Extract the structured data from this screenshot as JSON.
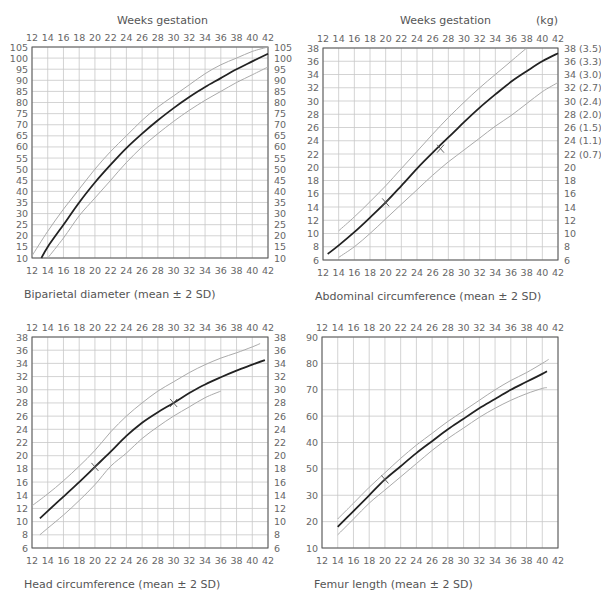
{
  "header": {
    "weeks_label_left": "Weeks gestation",
    "weeks_label_right": "Weeks gestation",
    "kg_label": "(kg)"
  },
  "colors": {
    "grid": "#c8c8c8",
    "frame": "#555555",
    "mean_line": "#222222",
    "sd_line": "#aaaaaa",
    "text": "#666666"
  },
  "chart_data": [
    {
      "id": "bpd",
      "type": "line",
      "title": "Biparietal diameter (mean ± 2 SD)",
      "xlabel": "Weeks gestation",
      "ylabel": "",
      "frame": {
        "x0": 32,
        "x1": 268,
        "y0": 47,
        "y1": 258
      },
      "xlim": [
        12,
        42
      ],
      "ylim": [
        10,
        105
      ],
      "x_ticks": [
        12,
        14,
        16,
        18,
        20,
        22,
        24,
        26,
        28,
        30,
        32,
        34,
        36,
        38,
        40,
        42
      ],
      "y_ticks_left": [
        "105",
        "100",
        "95",
        "90",
        "85",
        "80",
        "75",
        "70",
        "65",
        "60",
        "55",
        "50",
        "45",
        "40",
        "35",
        "30",
        "25",
        "20",
        "15",
        "10"
      ],
      "y_ticks_right": [
        "105",
        "100",
        "95",
        "90",
        "85",
        "80",
        "75",
        "70",
        "65",
        "60",
        "55",
        "50",
        "45",
        "40",
        "35",
        "30",
        "25",
        "20",
        "15",
        "10"
      ],
      "y_tick_values": [
        105,
        100,
        95,
        90,
        85,
        80,
        75,
        70,
        65,
        60,
        55,
        50,
        45,
        40,
        35,
        30,
        25,
        20,
        15,
        10
      ],
      "show_top_ticks": true,
      "show_bottom_ticks": true,
      "grid": true,
      "series": [
        {
          "name": "+2 SD",
          "role": "sd",
          "x": [
            12,
            14,
            16,
            18,
            20,
            22,
            24,
            26,
            28,
            30,
            32,
            34,
            36,
            38,
            40,
            42
          ],
          "y": [
            11,
            22,
            32,
            41,
            50,
            58,
            65,
            72,
            78,
            83,
            88,
            93,
            97,
            100,
            103,
            105
          ]
        },
        {
          "name": "mean",
          "role": "mean",
          "x": [
            13.2,
            14,
            16,
            18,
            20,
            22,
            24,
            26,
            28,
            30,
            32,
            34,
            36,
            38,
            40,
            42
          ],
          "y": [
            10,
            15,
            25,
            35,
            44,
            52,
            59.5,
            66,
            72,
            77.5,
            82.5,
            87,
            91,
            95,
            98.5,
            102
          ]
        },
        {
          "name": "-2 SD",
          "role": "sd",
          "x": [
            14,
            16,
            18,
            20,
            22,
            24,
            26,
            28,
            30,
            32,
            34,
            36,
            38,
            40,
            42
          ],
          "y": [
            10,
            19,
            29,
            37,
            45,
            53,
            60,
            66,
            71.5,
            76.5,
            81,
            85,
            89,
            92.5,
            96
          ]
        }
      ],
      "markers": []
    },
    {
      "id": "ac",
      "type": "line",
      "title": "Abdominal circumference (mean ± 2 SD)",
      "xlabel": "Weeks gestation",
      "ylabel": "",
      "frame": {
        "x0": 323,
        "x1": 558,
        "y0": 48,
        "y1": 260
      },
      "xlim": [
        12,
        42
      ],
      "ylim": [
        6,
        38
      ],
      "x_ticks": [
        12,
        14,
        16,
        18,
        20,
        22,
        24,
        26,
        28,
        30,
        32,
        34,
        36,
        38,
        40,
        42
      ],
      "y_ticks_left": [
        "38",
        "36",
        "34",
        "32",
        "30",
        "28",
        "26",
        "24",
        "22",
        "20",
        "18",
        "16",
        "14",
        "12",
        "10",
        "8",
        "6"
      ],
      "y_ticks_right": [
        "38 (3.5)",
        "36 (3.3)",
        "34 (3.0)",
        "32 (2.7)",
        "30 (2.4)",
        "28 (2.0)",
        "26 (1.5)",
        "24 (1.1)",
        "22 (0.7)",
        "20",
        "18",
        "16",
        "14",
        "12",
        "10",
        "8",
        "6"
      ],
      "y_tick_values": [
        38,
        36,
        34,
        32,
        30,
        28,
        26,
        24,
        22,
        20,
        18,
        16,
        14,
        12,
        10,
        8,
        6
      ],
      "show_top_ticks": true,
      "show_bottom_ticks": true,
      "grid": true,
      "series": [
        {
          "name": "+2 SD",
          "role": "sd",
          "x": [
            14,
            16,
            18,
            20,
            22,
            24,
            26,
            28,
            30,
            32,
            34,
            36,
            38
          ],
          "y": [
            10.4,
            12.5,
            14.8,
            17.2,
            19.8,
            22.4,
            25,
            27.5,
            29.8,
            32,
            34,
            36,
            38
          ]
        },
        {
          "name": "mean",
          "role": "mean",
          "x": [
            12.6,
            14,
            16,
            18,
            20,
            22,
            24,
            26,
            28,
            30,
            32,
            34,
            36,
            38,
            40,
            42
          ],
          "y": [
            6.9,
            8.2,
            10.2,
            12.4,
            14.7,
            17.2,
            19.8,
            22.2,
            24.5,
            26.8,
            29,
            31,
            32.9,
            34.5,
            36,
            37.2
          ]
        },
        {
          "name": "-2 SD",
          "role": "sd",
          "x": [
            14,
            16,
            18,
            20,
            22,
            24,
            26,
            28,
            30,
            32,
            34,
            36,
            38,
            40,
            42
          ],
          "y": [
            6.4,
            8,
            10,
            12.2,
            14.4,
            16.6,
            18.8,
            20.8,
            22.6,
            24.4,
            26.2,
            27.8,
            29.6,
            31.4,
            32.8
          ]
        }
      ],
      "markers": [
        {
          "x": 20,
          "y": 14.7
        },
        {
          "x": 27,
          "y": 22.8
        }
      ]
    },
    {
      "id": "hc",
      "type": "line",
      "title": "Head circumference (mean ± 2 SD)",
      "xlabel": "Weeks gestation",
      "ylabel": "",
      "frame": {
        "x0": 32,
        "x1": 268,
        "y0": 337,
        "y1": 548
      },
      "xlim": [
        12,
        42
      ],
      "ylim": [
        6,
        38
      ],
      "x_ticks": [
        12,
        14,
        16,
        18,
        20,
        22,
        24,
        26,
        28,
        30,
        32,
        34,
        36,
        38,
        40,
        42
      ],
      "y_ticks_left": [
        "38",
        "36",
        "34",
        "32",
        "30",
        "28",
        "26",
        "24",
        "22",
        "20",
        "18",
        "16",
        "14",
        "12",
        "10",
        "8",
        "6"
      ],
      "y_ticks_right": [
        "38",
        "36",
        "34",
        "32",
        "30",
        "28",
        "26",
        "24",
        "22",
        "20",
        "18",
        "16",
        "14",
        "12",
        "10",
        "8",
        "6"
      ],
      "y_tick_values": [
        38,
        36,
        34,
        32,
        30,
        28,
        26,
        24,
        22,
        20,
        18,
        16,
        14,
        12,
        10,
        8,
        6
      ],
      "show_top_ticks": true,
      "show_bottom_ticks": true,
      "grid": true,
      "series": [
        {
          "name": "+2 SD",
          "role": "sd",
          "x": [
            12,
            14,
            16,
            18,
            20,
            22,
            24,
            26,
            28,
            30,
            32,
            34,
            36,
            38,
            40,
            41
          ],
          "y": [
            12.4,
            14.2,
            16.2,
            18.4,
            20.8,
            23.6,
            26,
            28,
            29.8,
            31.2,
            32.6,
            33.8,
            34.8,
            35.6,
            36.5,
            37
          ]
        },
        {
          "name": "mean",
          "role": "mean",
          "x": [
            13,
            14,
            16,
            18,
            20,
            22,
            24,
            26,
            28,
            30,
            32,
            34,
            36,
            38,
            40,
            41.6
          ],
          "y": [
            10.5,
            11.6,
            13.8,
            16,
            18.3,
            20.6,
            23,
            25,
            26.6,
            28,
            29.5,
            30.8,
            31.9,
            32.9,
            33.8,
            34.5
          ]
        },
        {
          "name": "-2 SD",
          "role": "sd",
          "x": [
            13,
            14,
            16,
            18,
            20,
            22,
            24,
            26,
            28,
            30,
            32,
            34,
            36
          ],
          "y": [
            8,
            9,
            11,
            13.2,
            15.6,
            18.4,
            20.4,
            22.6,
            24.4,
            26,
            27.4,
            28.8,
            29.8
          ]
        }
      ],
      "markers": [
        {
          "x": 20,
          "y": 18.3
        },
        {
          "x": 30,
          "y": 28
        }
      ]
    },
    {
      "id": "fl",
      "type": "line",
      "title": "Femur length (mean ± 2 SD)",
      "xlabel": "Weeks gestation",
      "ylabel": "",
      "frame": {
        "x0": 322,
        "x1": 558,
        "y0": 337,
        "y1": 548
      },
      "xlim": [
        12,
        42
      ],
      "ylim": [
        10,
        90
      ],
      "x_ticks": [
        12,
        14,
        16,
        18,
        20,
        22,
        24,
        26,
        28,
        30,
        32,
        34,
        36,
        38,
        40,
        42
      ],
      "y_ticks_left": [
        "90",
        "80",
        "70",
        "60",
        "40",
        "50",
        "30",
        "20",
        "10"
      ],
      "y_ticks_right": [],
      "y_tick_values": [
        90,
        80,
        70,
        60,
        50,
        40,
        30,
        20,
        10
      ],
      "show_top_ticks": true,
      "show_bottom_ticks": true,
      "grid": true,
      "series": [
        {
          "name": "+2 SD",
          "role": "sd",
          "x": [
            14,
            16,
            18,
            20,
            22,
            24,
            26,
            28,
            30,
            32,
            34,
            36,
            38,
            40,
            40.8
          ],
          "y": [
            21,
            27,
            33,
            38.5,
            44,
            49,
            53.5,
            58,
            62,
            66,
            70,
            73.5,
            76.5,
            80,
            81.5
          ]
        },
        {
          "name": "mean",
          "role": "mean",
          "x": [
            14,
            16,
            18,
            20,
            22,
            24,
            26,
            28,
            30,
            32,
            34,
            36,
            38,
            40,
            40.6
          ],
          "y": [
            18,
            24,
            30,
            36,
            41,
            46,
            50.5,
            55,
            59,
            63,
            66.5,
            70,
            73,
            76,
            77
          ]
        },
        {
          "name": "-2 SD",
          "role": "sd",
          "x": [
            14,
            16,
            18,
            20,
            22,
            24,
            26,
            28,
            30,
            32,
            34,
            36,
            38,
            40,
            40.6
          ],
          "y": [
            15,
            21,
            27,
            32,
            37,
            42,
            47,
            51.5,
            55.5,
            59.5,
            63,
            66,
            68.5,
            70.5,
            70.8
          ]
        }
      ],
      "markers": [
        {
          "x": 20,
          "y": 36
        }
      ]
    }
  ]
}
